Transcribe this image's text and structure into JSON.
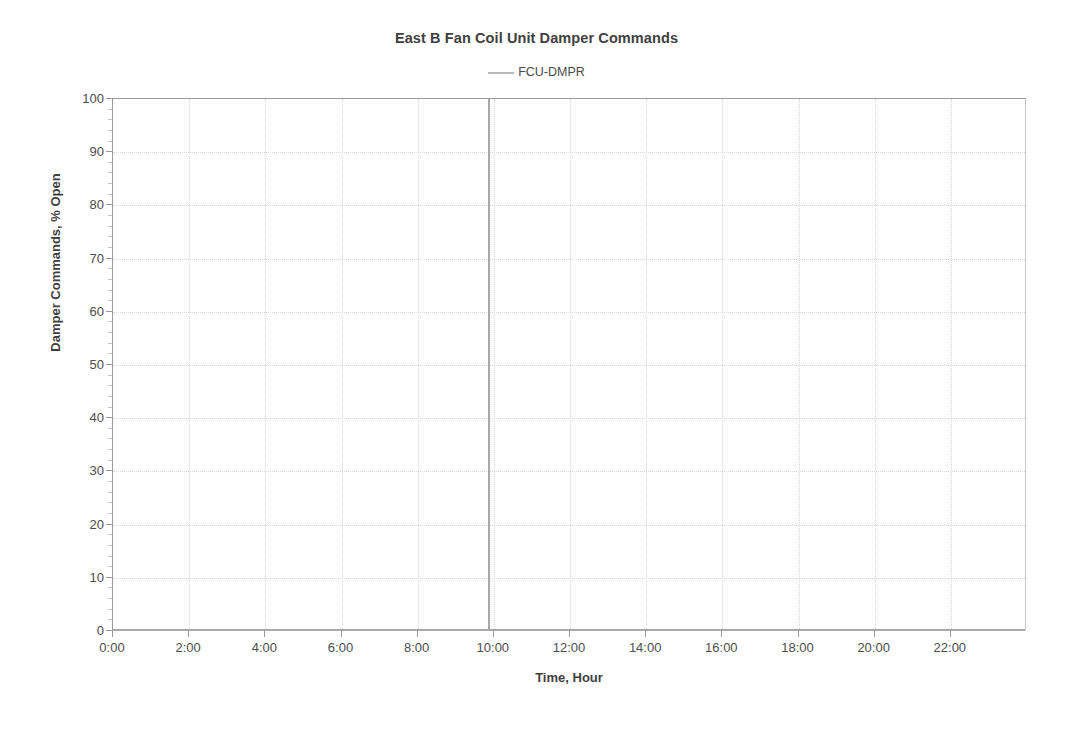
{
  "chart_data": {
    "type": "line",
    "title": "East B Fan Coil Unit Damper Commands",
    "xlabel": "Time, Hour",
    "ylabel": "Damper Commands, % Open",
    "grid": true,
    "legend_position": "top-center",
    "legend": [
      "FCU-DMPR"
    ],
    "series_color": "#a8a8a8",
    "xlim": [
      0,
      24
    ],
    "ylim": [
      0,
      100
    ],
    "ytick_step": 10,
    "yminor_step": 2,
    "xtick_step": 2,
    "x_tick_labels": [
      "0:00",
      "2:00",
      "4:00",
      "6:00",
      "8:00",
      "10:00",
      "12:00",
      "14:00",
      "16:00",
      "18:00",
      "20:00",
      "22:00"
    ],
    "x_tick_values": [
      0,
      2,
      4,
      6,
      8,
      10,
      12,
      14,
      16,
      18,
      20,
      22
    ],
    "y_tick_labels": [
      "0",
      "10",
      "20",
      "30",
      "40",
      "50",
      "60",
      "70",
      "80",
      "90",
      "100"
    ],
    "y_tick_values": [
      0,
      10,
      20,
      30,
      40,
      50,
      60,
      70,
      80,
      90,
      100
    ],
    "series": [
      {
        "name": "FCU-DMPR",
        "x": [
          0,
          9.8,
          9.85,
          9.9,
          24
        ],
        "values": [
          0,
          0,
          100,
          0,
          0
        ]
      }
    ],
    "annotations": [
      {
        "name": "damper-spike",
        "x": 9.85,
        "y_from": 0,
        "y_to": 100,
        "note": "vertical spike to 100% at approximately 9:50"
      }
    ]
  }
}
